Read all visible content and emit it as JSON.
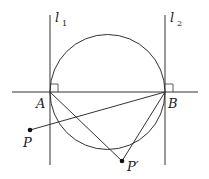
{
  "figure": {
    "lines": [
      {
        "id": "l1",
        "label": "l",
        "subscript": "1"
      },
      {
        "id": "l2",
        "label": "l",
        "subscript": "2"
      }
    ],
    "points": [
      {
        "id": "A",
        "label": "A"
      },
      {
        "id": "B",
        "label": "B"
      },
      {
        "id": "P",
        "label": "P"
      },
      {
        "id": "P_prime",
        "label": "P′"
      }
    ],
    "colors": {
      "stroke": "#333333",
      "point": "#111111"
    }
  }
}
